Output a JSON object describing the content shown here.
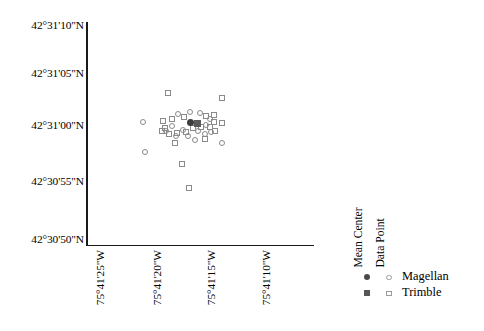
{
  "chart_data": {
    "type": "scatter",
    "title": "",
    "xlabel": "",
    "ylabel": "",
    "grid": false,
    "legend_position": "right",
    "x_ticks": [
      "75°41'25\"W",
      "75°41'20\"W",
      "75°41'15\"W",
      "75°41'10\"W"
    ],
    "y_ticks": [
      "42°31'10\"N",
      "42°31'05\"N",
      "42°31'00\"N",
      "42°30'55\"N",
      "42°30'50\"N"
    ],
    "x_tick_px": [
      90,
      147,
      201,
      256
    ],
    "y_tick_px": [
      26,
      74,
      126,
      182,
      240
    ],
    "xlim": [
      "75°41'27\"W",
      "75°41'08\"W"
    ],
    "ylim": [
      "42°30'50\"N",
      "42°31'11\"N"
    ],
    "series": [
      {
        "name": "Magellan",
        "marker": "circle-open",
        "color": "#8a8a8a",
        "points": [
          [
            143,
            122
          ],
          [
            145,
            152
          ],
          [
            178,
            114
          ],
          [
            190,
            112
          ],
          [
            200,
            113
          ],
          [
            183,
            130
          ],
          [
            172,
            126
          ],
          [
            166,
            131
          ],
          [
            198,
            131
          ],
          [
            206,
            125
          ],
          [
            210,
            119
          ],
          [
            195,
            140
          ],
          [
            222,
            143
          ],
          [
            205,
            134
          ],
          [
            188,
            136
          ],
          [
            176,
            136
          ],
          [
            211,
            132
          ]
        ]
      },
      {
        "name": "Trimble",
        "marker": "square-open",
        "color": "#8a8a8a",
        "points": [
          [
            168,
            93
          ],
          [
            222,
            98
          ],
          [
            163,
            121
          ],
          [
            172,
            119
          ],
          [
            184,
            117
          ],
          [
            206,
            116
          ],
          [
            214,
            115
          ],
          [
            222,
            123
          ],
          [
            210,
            127
          ],
          [
            201,
            127
          ],
          [
            165,
            128
          ],
          [
            169,
            134
          ],
          [
            177,
            133
          ],
          [
            186,
            132
          ],
          [
            193,
            128
          ],
          [
            205,
            139
          ],
          [
            215,
            131
          ],
          [
            189,
            188
          ],
          [
            175,
            143
          ],
          [
            162,
            131
          ],
          [
            182,
            164
          ],
          [
            214,
            122
          ]
        ]
      },
      {
        "name": "Magellan Mean Center",
        "marker": "circle-fill",
        "color": "#3d3d3d",
        "points": [
          [
            190,
            122
          ]
        ]
      },
      {
        "name": "Trimble Mean Center",
        "marker": "square-fill",
        "color": "#5a5a5a",
        "points": [
          [
            197,
            123
          ]
        ]
      }
    ]
  },
  "legend": {
    "column_headers": [
      "Mean Center",
      "Data Point"
    ],
    "rows": [
      {
        "label": "Magellan",
        "mean_center_marker": "filled-circle",
        "data_point_marker": "open-circle"
      },
      {
        "label": "Trimble",
        "mean_center_marker": "filled-square",
        "data_point_marker": "open-square"
      }
    ]
  }
}
